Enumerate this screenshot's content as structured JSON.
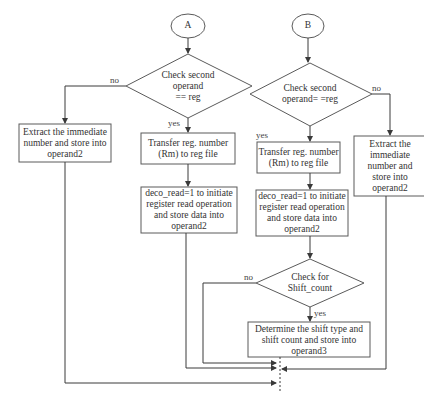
{
  "diagram": {
    "branch_a": {
      "start": "A",
      "decision": "Check second\noperand\n== reg",
      "no_label": "no",
      "yes_label": "yes",
      "immediate_box": "Extract the immediate\nnumber and store into\noperand2",
      "transfer_box": "Transfer reg. number\n(Rm) to reg file",
      "deco_box": "deco_read=1 to initiate\nregister read operation\nand store data into\noperand2"
    },
    "branch_b": {
      "start": "B",
      "decision": "Check second\noperand= =reg",
      "no_label": "no",
      "yes_label": "yes",
      "transfer_box": "Transfer reg. number\n(Rm) to reg file",
      "deco_box": "deco_read=1 to initiate\nregister read operation\nand store data into\noperand2",
      "immediate_box": "Extract the\nimmediate\nnumber and\nstore into\noperand2",
      "shift_decision": "Check for\nShift_count",
      "shift_no_label": "no",
      "shift_yes_label": "yes",
      "shift_box": "Determine the shift type and\nshift count and store into\noperand3"
    },
    "colors": {
      "line": "#3a3a3a",
      "border": "#5a5a5a",
      "text": "#333333",
      "background": "#ffffff"
    }
  }
}
